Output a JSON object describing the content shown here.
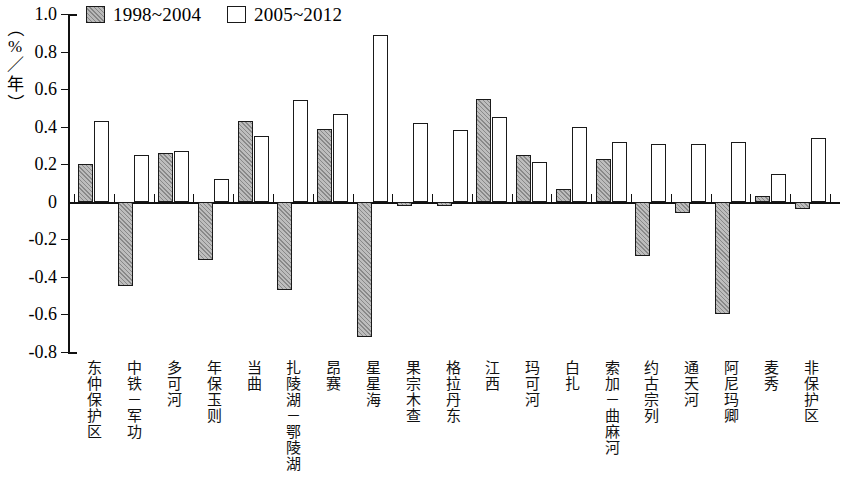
{
  "legend": {
    "items": [
      {
        "label": "1998~2004",
        "style": "hatched-gray",
        "color": "#bdbdbd"
      },
      {
        "label": "2005~2012",
        "style": "open-white",
        "color": "#ffffff"
      }
    ]
  },
  "axis": {
    "y_title_chars": [
      "（",
      "%",
      "／",
      "年",
      "）"
    ],
    "y_title": "（%／年）",
    "y_ticks": [
      "1.0",
      "0.8",
      "0.6",
      "0.4",
      "0.2",
      "0",
      "-0.2",
      "-0.4",
      "-0.6",
      "-0.8"
    ],
    "y_tick_values": [
      1.0,
      0.8,
      0.6,
      0.4,
      0.2,
      0,
      -0.2,
      -0.4,
      -0.6,
      -0.8
    ]
  },
  "chart_data": {
    "type": "bar",
    "title": "",
    "xlabel": "",
    "ylabel": "（%／年）",
    "ylim": [
      -0.8,
      1.0
    ],
    "ytick_step": 0.2,
    "grid": false,
    "legend_position": "top-left",
    "categories": [
      "东仲保护区",
      "中铁－军功",
      "多可河",
      "年保玉则",
      "当曲",
      "扎陵湖－鄂陵湖",
      "昂赛",
      "星星海",
      "果宗木查",
      "格拉丹东",
      "江西",
      "玛可河",
      "白扎",
      "索加－曲麻河",
      "约古宗列",
      "通天河",
      "阿尼玛卿",
      "麦秀",
      "非保护区"
    ],
    "series": [
      {
        "name": "1998~2004",
        "values": [
          0.2,
          -0.45,
          0.26,
          -0.31,
          0.43,
          -0.47,
          0.39,
          -0.72,
          -0.02,
          -0.02,
          0.55,
          0.25,
          0.07,
          0.23,
          -0.29,
          -0.06,
          -0.6,
          0.03,
          -0.04
        ]
      },
      {
        "name": "2005~2012",
        "values": [
          0.43,
          0.25,
          0.27,
          0.12,
          0.35,
          0.54,
          0.47,
          0.89,
          0.42,
          0.38,
          0.45,
          0.21,
          0.4,
          0.32,
          0.31,
          0.31,
          0.32,
          0.15,
          0.34
        ]
      }
    ]
  }
}
